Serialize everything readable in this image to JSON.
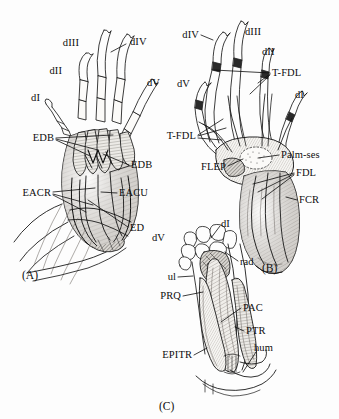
{
  "figure": {
    "background_color": "#fdfdfd",
    "ink_color": "#111111",
    "panels": [
      {
        "id": "A",
        "tag": "(A)",
        "caption": "Dorsal view of manus with extensor musculature"
      },
      {
        "id": "B",
        "tag": "(B)",
        "caption": "Palmar view of manus with flexor musculature"
      },
      {
        "id": "C",
        "tag": "(C)",
        "caption": "Antebrachium with pronator musculature"
      }
    ]
  },
  "panel_a": {
    "tag": "(A)",
    "tag_pos": {
      "x": 22,
      "y": 269
    },
    "labels": [
      {
        "text": "dIII",
        "x": 79,
        "y": 43,
        "anchor": "e",
        "leaders": []
      },
      {
        "text": "dIV",
        "x": 130,
        "y": 42,
        "anchor": "w",
        "leaders": [
          [
            126,
            44,
            111,
            52
          ]
        ]
      },
      {
        "text": "dII",
        "x": 62,
        "y": 71,
        "anchor": "e",
        "leaders": []
      },
      {
        "text": "dV",
        "x": 147,
        "y": 83,
        "anchor": "w",
        "leaders": []
      },
      {
        "text": "dI",
        "x": 40,
        "y": 98,
        "anchor": "e",
        "leaders": []
      },
      {
        "text": "EDB",
        "x": 54,
        "y": 138,
        "anchor": "e",
        "leaders": [
          [
            56,
            138,
            113,
            135
          ],
          [
            56,
            139,
            98,
            150
          ],
          [
            56,
            140,
            90,
            156
          ]
        ]
      },
      {
        "text": "EDB",
        "x": 131,
        "y": 165,
        "anchor": "w",
        "leaders": [
          [
            129,
            165,
            103,
            154
          ],
          [
            129,
            166,
            110,
            172
          ]
        ]
      },
      {
        "text": "EACR",
        "x": 51,
        "y": 193,
        "anchor": "e",
        "leaders": [
          [
            53,
            192,
            95,
            188
          ],
          [
            53,
            194,
            93,
            205
          ],
          [
            53,
            195,
            86,
            212
          ]
        ]
      },
      {
        "text": "EACU",
        "x": 119,
        "y": 193,
        "anchor": "w",
        "leaders": [
          [
            117,
            193,
            101,
            192
          ]
        ]
      },
      {
        "text": "ED",
        "x": 130,
        "y": 228,
        "anchor": "w",
        "leaders": [
          [
            128,
            227,
            88,
            200
          ]
        ]
      }
    ]
  },
  "panel_b": {
    "tag": "(B)",
    "tag_pos": {
      "x": 262,
      "y": 262
    },
    "labels": [
      {
        "text": "dIV",
        "x": 199,
        "y": 35,
        "anchor": "e",
        "leaders": [
          [
            201,
            35,
            213,
            40
          ]
        ]
      },
      {
        "text": "dIII",
        "x": 245,
        "y": 32,
        "anchor": "w",
        "leaders": []
      },
      {
        "text": "dII",
        "x": 262,
        "y": 52,
        "anchor": "w",
        "leaders": []
      },
      {
        "text": "T-FDL",
        "x": 272,
        "y": 73,
        "anchor": "w",
        "leaders": [
          [
            270,
            73,
            214,
            70
          ],
          [
            270,
            74,
            258,
            83
          ],
          [
            270,
            75,
            250,
            94
          ]
        ]
      },
      {
        "text": "dV",
        "x": 190,
        "y": 84,
        "anchor": "e",
        "leaders": []
      },
      {
        "text": "dI",
        "x": 295,
        "y": 95,
        "anchor": "w",
        "leaders": []
      },
      {
        "text": "T-FDL",
        "x": 196,
        "y": 136,
        "anchor": "e",
        "leaders": [
          [
            198,
            135,
            223,
            119
          ],
          [
            198,
            136,
            226,
            128
          ],
          [
            198,
            138,
            222,
            140
          ]
        ]
      },
      {
        "text": "Palm-ses",
        "x": 281,
        "y": 155,
        "anchor": "w",
        "leaders": [
          [
            279,
            155,
            258,
            158
          ]
        ]
      },
      {
        "text": "FLEP",
        "x": 226,
        "y": 167,
        "anchor": "e",
        "leaders": [
          [
            228,
            166,
            243,
            159
          ]
        ]
      },
      {
        "text": "FDL",
        "x": 296,
        "y": 173,
        "anchor": "w",
        "leaders": [
          [
            294,
            173,
            253,
            184
          ],
          [
            294,
            174,
            258,
            192
          ],
          [
            294,
            175,
            262,
            199
          ]
        ]
      },
      {
        "text": "FCR",
        "x": 299,
        "y": 200,
        "anchor": "w",
        "leaders": [
          [
            297,
            200,
            286,
            197
          ]
        ]
      }
    ]
  },
  "panel_c": {
    "tag": "(C)",
    "tag_pos": {
      "x": 159,
      "y": 400
    },
    "labels": [
      {
        "text": "dI",
        "x": 221,
        "y": 224,
        "anchor": "w",
        "leaders": [
          [
            220,
            226,
            211,
            238
          ]
        ]
      },
      {
        "text": "dV",
        "x": 165,
        "y": 238,
        "anchor": "e",
        "leaders": []
      },
      {
        "text": "rad",
        "x": 240,
        "y": 262,
        "anchor": "w",
        "leaders": [
          [
            238,
            261,
            225,
            252
          ]
        ]
      },
      {
        "text": "ul",
        "x": 176,
        "y": 277,
        "anchor": "e",
        "leaders": [
          [
            178,
            277,
            193,
            276
          ]
        ]
      },
      {
        "text": "PRQ",
        "x": 181,
        "y": 296,
        "anchor": "e",
        "leaders": [
          [
            183,
            296,
            203,
            292
          ]
        ]
      },
      {
        "text": "PAC",
        "x": 243,
        "y": 308,
        "anchor": "w",
        "leaders": [
          [
            241,
            308,
            221,
            322
          ]
        ]
      },
      {
        "text": "PTR",
        "x": 246,
        "y": 331,
        "anchor": "w",
        "leaders": [
          [
            244,
            331,
            235,
            327
          ]
        ]
      },
      {
        "text": "hum",
        "x": 254,
        "y": 348,
        "anchor": "w",
        "leaders": [
          [
            256,
            352,
            243,
            372
          ]
        ]
      },
      {
        "text": "EPITR",
        "x": 192,
        "y": 355,
        "anchor": "e",
        "leaders": [
          [
            194,
            355,
            207,
            348
          ]
        ]
      }
    ]
  }
}
